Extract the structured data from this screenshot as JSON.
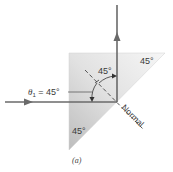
{
  "diagram": {
    "caption": "(a)",
    "prism": {
      "shape": "right-isosceles-triangle",
      "angle_top_right": "45°",
      "angle_bottom_left": "45°",
      "fill_light": "#f4f4f4",
      "fill_dark": "#c8c8c8"
    },
    "incident_angle_label": {
      "symbol": "θ",
      "subscript": "1",
      "value": " = 45°"
    },
    "reflected_angle_label": "45°",
    "normal_label": "Normal",
    "rays": {
      "incident": "horizontal, left to right",
      "reflected": "vertical, upward",
      "color": "#6a6a6a"
    }
  }
}
